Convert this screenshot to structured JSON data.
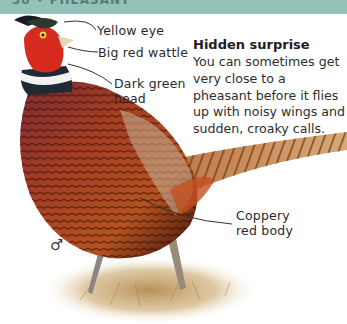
{
  "header": {
    "text": "38 • PHEASANT",
    "band_color": "#93c2b8"
  },
  "labels": {
    "yellow_eye": "Yellow eye",
    "wattle": "Big red wattle",
    "head": "Dark green\nhead",
    "body": "Coppery\nred body"
  },
  "panel": {
    "title": "Hidden surprise",
    "body": "You can sometimes get very close to a pheasant before it flies up with noisy wings and sudden, croaky calls."
  },
  "sex_symbol": "♂",
  "colors": {
    "wattle_red": "#d62a1e",
    "body_copper": "#9a3a1c",
    "breast_purple": "#7a2a33",
    "tail": "#c98a55",
    "grass": "#c9a46a"
  }
}
